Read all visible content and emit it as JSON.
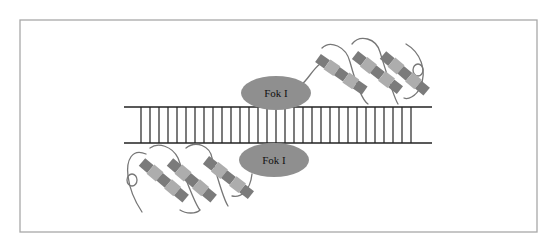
{
  "diagram": {
    "frame": {
      "x": 20,
      "y": 20,
      "width": 517,
      "height": 212,
      "stroke": "#a8a8a8"
    },
    "dna": {
      "top_strand_y": 107,
      "bottom_strand_y": 143,
      "x_start": 124,
      "x_end": 432,
      "rung_x_start": 141,
      "rung_x_end": 415,
      "rung_spacing": 9,
      "color": "#222222"
    },
    "nucleases": [
      {
        "label": "Fok I",
        "cx": 276,
        "cy": 93,
        "rx": 35,
        "ry": 17,
        "color": "#8f8f8f",
        "position": "top"
      },
      {
        "label": "Fok I",
        "cx": 274,
        "cy": 160,
        "rx": 35,
        "ry": 17,
        "color": "#8f8f8f",
        "position": "bottom"
      }
    ],
    "zinc_finger_arrays": [
      {
        "position": "top-right",
        "finger_count": 3
      },
      {
        "position": "bottom-left",
        "finger_count": 3
      }
    ],
    "colors": {
      "helix_dark": "#7b7b7b",
      "helix_light": "#adadad",
      "loop": "#777777"
    }
  }
}
